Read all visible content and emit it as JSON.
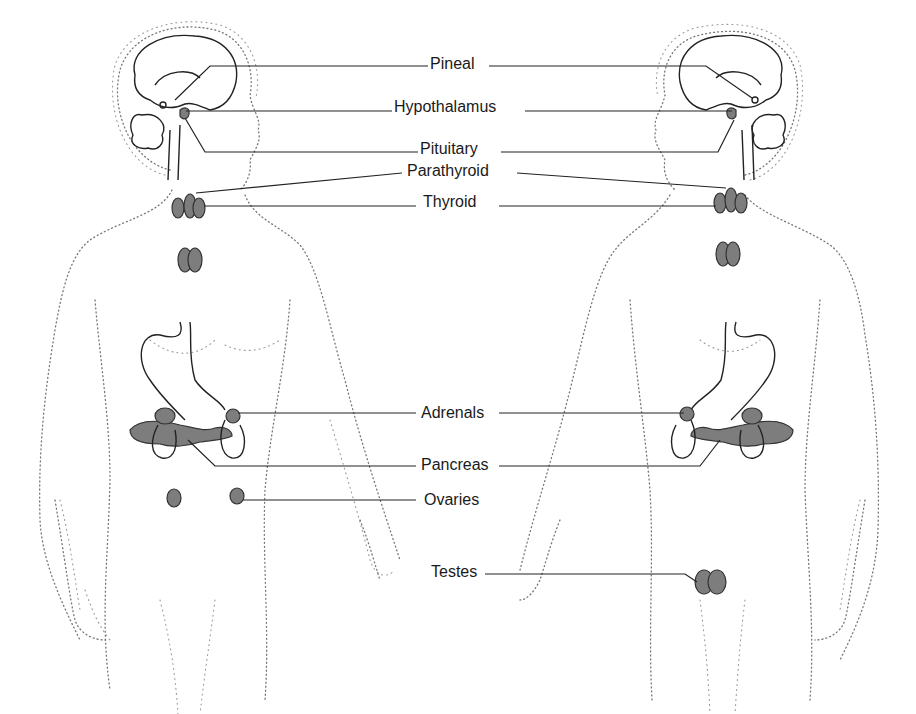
{
  "diagram": {
    "figures": [
      "female",
      "male"
    ],
    "labels": {
      "pineal": "Pineal",
      "hypothalamus": "Hypothalamus",
      "pituitary": "Pituitary",
      "parathyroid": "Parathyroid",
      "thyroid": "Thyroid",
      "adrenals": "Adrenals",
      "pancreas": "Pancreas",
      "ovaries": "Ovaries",
      "testes": "Testes"
    },
    "colors": {
      "gland_fill": "#7d7d7d",
      "line": "#222222",
      "body_dots": "#777777",
      "background": "#ffffff"
    }
  }
}
